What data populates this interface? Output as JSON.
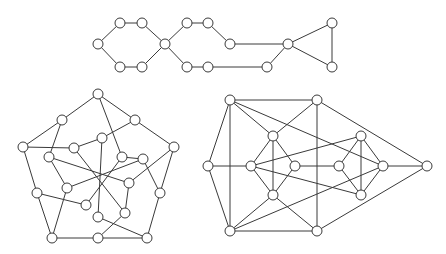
{
  "style": {
    "edge_color": "#3a3a3a",
    "node_fill": "#ffffff",
    "node_stroke": "#3a3a3a",
    "node_radius": 5
  },
  "graphs": [
    {
      "name": "top-chain-graph",
      "nodes": [
        [
          98,
          44
        ],
        [
          120,
          23
        ],
        [
          142,
          23
        ],
        [
          165,
          44
        ],
        [
          142,
          67
        ],
        [
          120,
          67
        ],
        [
          187,
          23
        ],
        [
          208,
          23
        ],
        [
          230,
          44
        ],
        [
          208,
          67
        ],
        [
          187,
          67
        ],
        [
          267,
          67
        ],
        [
          288,
          44
        ],
        [
          332,
          23
        ],
        [
          332,
          67
        ]
      ],
      "edges": [
        [
          0,
          1
        ],
        [
          1,
          2
        ],
        [
          2,
          3
        ],
        [
          3,
          4
        ],
        [
          4,
          5
        ],
        [
          5,
          0
        ],
        [
          3,
          6
        ],
        [
          6,
          7
        ],
        [
          7,
          8
        ],
        [
          3,
          10
        ],
        [
          10,
          9
        ],
        [
          8,
          12
        ],
        [
          9,
          11
        ],
        [
          11,
          12
        ],
        [
          12,
          13
        ],
        [
          13,
          14
        ],
        [
          12,
          14
        ]
      ]
    },
    {
      "name": "left-pentagon-graph",
      "nodes": [
        [
          98,
          94
        ],
        [
          62,
          120
        ],
        [
          135,
          120
        ],
        [
          23,
          147
        ],
        [
          174,
          147
        ],
        [
          37,
          193
        ],
        [
          160,
          193
        ],
        [
          52,
          238
        ],
        [
          98,
          238
        ],
        [
          147,
          238
        ],
        [
          102,
          138
        ],
        [
          74,
          148
        ],
        [
          49,
          157
        ],
        [
          122,
          157
        ],
        [
          143,
          159
        ],
        [
          129,
          183
        ],
        [
          67,
          188
        ],
        [
          86,
          205
        ],
        [
          125,
          213
        ],
        [
          98,
          217
        ]
      ],
      "edges": [
        [
          0,
          1
        ],
        [
          0,
          2
        ],
        [
          0,
          13
        ],
        [
          1,
          3
        ],
        [
          1,
          12
        ],
        [
          2,
          4
        ],
        [
          2,
          10
        ],
        [
          3,
          11
        ],
        [
          3,
          5
        ],
        [
          11,
          10
        ],
        [
          11,
          18
        ],
        [
          10,
          19
        ],
        [
          4,
          6
        ],
        [
          4,
          15
        ],
        [
          13,
          14
        ],
        [
          13,
          17
        ],
        [
          14,
          6
        ],
        [
          14,
          16
        ],
        [
          12,
          16
        ],
        [
          12,
          15
        ],
        [
          16,
          7
        ],
        [
          5,
          7
        ],
        [
          5,
          17
        ],
        [
          15,
          18
        ],
        [
          18,
          8
        ],
        [
          19,
          9
        ],
        [
          7,
          8
        ],
        [
          8,
          9
        ],
        [
          9,
          6
        ]
      ]
    },
    {
      "name": "right-diamond-graph",
      "nodes": [
        [
          230,
          100
        ],
        [
          317,
          100
        ],
        [
          208,
          166
        ],
        [
          230,
          231
        ],
        [
          317,
          231
        ],
        [
          427,
          166
        ],
        [
          273,
          136
        ],
        [
          251,
          166
        ],
        [
          295,
          166
        ],
        [
          273,
          195
        ],
        [
          361,
          136
        ],
        [
          339,
          166
        ],
        [
          383,
          166
        ],
        [
          361,
          195
        ]
      ],
      "edges": [
        [
          0,
          1
        ],
        [
          0,
          2
        ],
        [
          0,
          3
        ],
        [
          0,
          6
        ],
        [
          0,
          12
        ],
        [
          1,
          6
        ],
        [
          1,
          4
        ],
        [
          1,
          5
        ],
        [
          2,
          7
        ],
        [
          2,
          3
        ],
        [
          3,
          4
        ],
        [
          3,
          9
        ],
        [
          3,
          12
        ],
        [
          4,
          9
        ],
        [
          4,
          5
        ],
        [
          6,
          7
        ],
        [
          6,
          8
        ],
        [
          6,
          9
        ],
        [
          7,
          9
        ],
        [
          8,
          9
        ],
        [
          7,
          10
        ],
        [
          7,
          13
        ],
        [
          8,
          11
        ],
        [
          10,
          11
        ],
        [
          10,
          12
        ],
        [
          10,
          13
        ],
        [
          11,
          13
        ],
        [
          12,
          13
        ],
        [
          12,
          5
        ]
      ]
    }
  ]
}
